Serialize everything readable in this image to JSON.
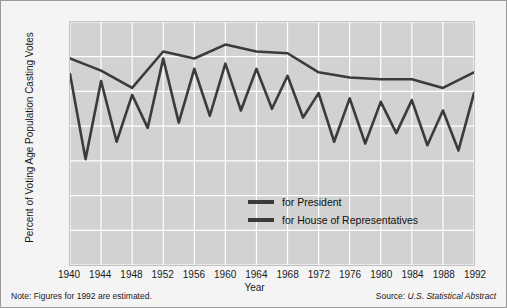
{
  "chart_data": {
    "type": "line",
    "title": "",
    "xlabel": "Year",
    "ylabel": "Percent of Voting Age Population Casting Votes",
    "xlim": [
      1940,
      1992
    ],
    "ylim": [
      0,
      70
    ],
    "yticks": [
      0,
      10,
      20,
      30,
      40,
      50,
      60,
      70
    ],
    "xticks": [
      1940,
      1944,
      1948,
      1952,
      1956,
      1960,
      1964,
      1968,
      1972,
      1976,
      1980,
      1984,
      1988,
      1992
    ],
    "grid": true,
    "legend_position": "inside-center-bottom",
    "line_color": "#3b3b3b",
    "plot_background": "#d2d2d2",
    "x": [
      1940,
      1942,
      1944,
      1946,
      1948,
      1950,
      1952,
      1954,
      1956,
      1958,
      1960,
      1962,
      1964,
      1966,
      1968,
      1970,
      1972,
      1974,
      1976,
      1978,
      1980,
      1982,
      1984,
      1986,
      1988,
      1990,
      1992
    ],
    "series": [
      {
        "name": "for President",
        "x": [
          1940,
          1944,
          1948,
          1952,
          1956,
          1960,
          1964,
          1968,
          1972,
          1976,
          1980,
          1984,
          1988,
          1992
        ],
        "values": [
          59.5,
          56.0,
          51.0,
          61.5,
          59.5,
          63.5,
          61.5,
          61.0,
          55.5,
          54.0,
          53.5,
          53.5,
          51.0,
          55.5
        ]
      },
      {
        "name": "for House of Representatives",
        "x": [
          1940,
          1942,
          1944,
          1946,
          1948,
          1950,
          1952,
          1954,
          1956,
          1958,
          1960,
          1962,
          1964,
          1966,
          1968,
          1970,
          1972,
          1974,
          1976,
          1978,
          1980,
          1982,
          1984,
          1986,
          1988,
          1990,
          1992
        ],
        "values": [
          55.0,
          30.5,
          53.0,
          35.5,
          49.0,
          39.5,
          59.5,
          41.0,
          56.5,
          43.0,
          58.0,
          44.5,
          56.5,
          45.0,
          54.5,
          42.5,
          49.5,
          35.5,
          48.0,
          35.0,
          47.0,
          38.0,
          47.5,
          34.5,
          44.5,
          33.0,
          49.5
        ]
      }
    ],
    "legend": [
      "for President",
      "for House of Representatives"
    ]
  },
  "footnotes": {
    "note": "Note: Figures for 1992 are estimated.",
    "source_prefix": "Source: ",
    "source_value": "U.S. Statistical Abstract"
  }
}
